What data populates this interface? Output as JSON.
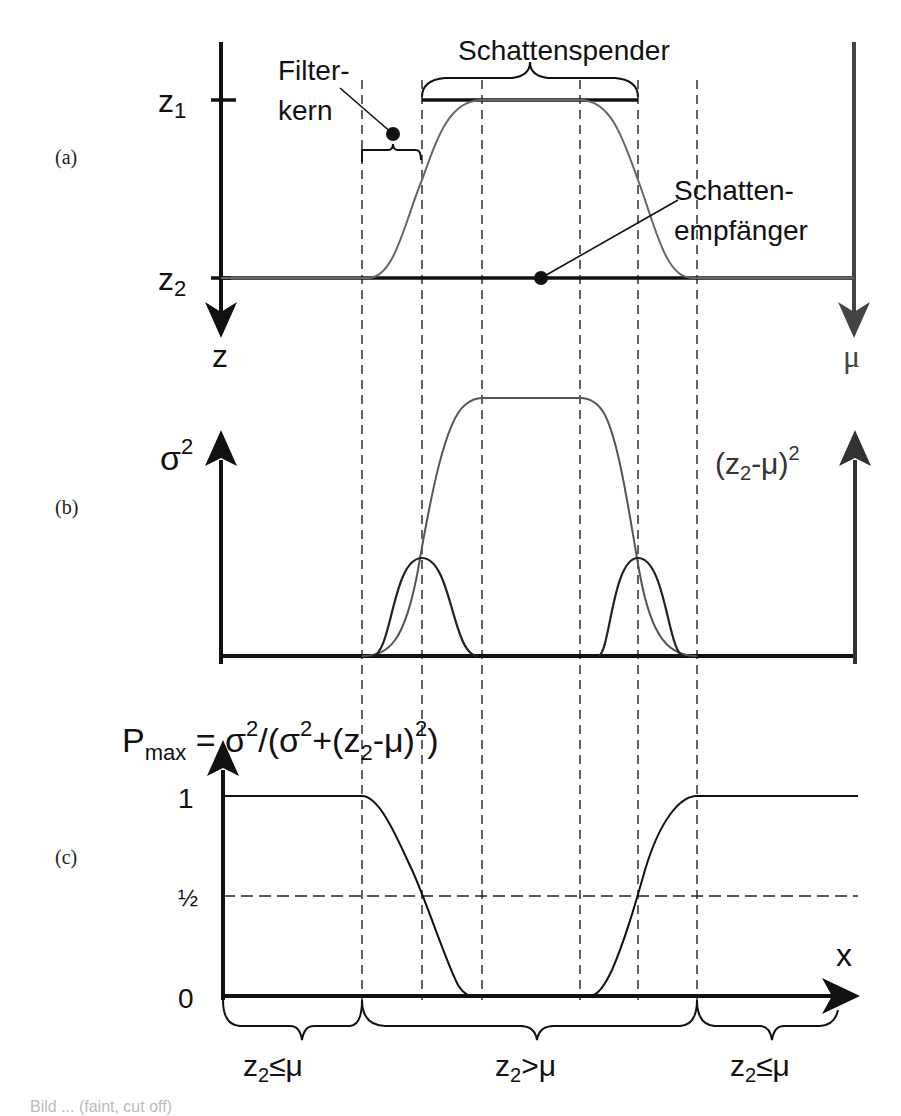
{
  "panels": {
    "a": {
      "label": "(a)",
      "axis_left": {
        "tick_top": "z",
        "tick_top_sub": "1",
        "tick_bottom": "z",
        "tick_bottom_sub": "2",
        "arrow_label": "z"
      },
      "axis_right": {
        "arrow_label": "μ"
      },
      "annotations": {
        "shadow_caster": "Schattenspender",
        "filter_kernel_line1": "Filter-",
        "filter_kernel_line2": "kern",
        "shadow_receiver_line1": "Schatten-",
        "shadow_receiver_line2": "empfänger"
      }
    },
    "b": {
      "label": "(b)",
      "axis_left_label": "σ",
      "axis_left_sup": "2",
      "axis_right_label_pre": "(z",
      "axis_right_label_sub": "2",
      "axis_right_label_post": "-μ)",
      "axis_right_sup": "2"
    },
    "c": {
      "label": "(c)",
      "formula": {
        "p": "P",
        "p_sub": "max",
        "rest_1": " = σ",
        "sup_1": "2",
        "rest_2": "/(σ",
        "sup_2": "2",
        "rest_3": "+(z",
        "sub_3": "2",
        "rest_4": "-μ)",
        "sup_4": "2",
        "rest_5": ")"
      },
      "y_ticks": [
        "1",
        "½",
        "0"
      ],
      "x_label": "x",
      "regions": [
        {
          "pre": "z",
          "sub": "2",
          "post": "≤μ"
        },
        {
          "pre": "z",
          "sub": "2",
          "post": ">μ"
        },
        {
          "pre": "z",
          "sub": "2",
          "post": "≤μ"
        }
      ]
    }
  },
  "colors": {
    "axis": "#111111",
    "mu_curve": "#666666",
    "mu_axis": "#444444",
    "sigma_curve": "#222222",
    "dashed": "#222222"
  },
  "caption": "Bild ... (faint, cut off)"
}
